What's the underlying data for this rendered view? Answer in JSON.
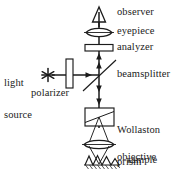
{
  "diagram": {
    "type": "optical-schematic",
    "background_color": "#ffffff",
    "line_color": "#1b1b1b",
    "labels": {
      "observer": "observer",
      "eyepiece": "eyepiece",
      "analyzer": "analyzer",
      "beamsplitter": "beamsplitter",
      "light_source_line1": "light",
      "light_source_line2": "source",
      "polarizer": "polarizer",
      "wollaston_line1": "Wollaston",
      "wollaston_line2": "prism",
      "objective_line1": "objective",
      "objective_line2": "lens",
      "sample": "sample"
    },
    "components": [
      {
        "name": "observer",
        "icon": "triangle-eye-icon"
      },
      {
        "name": "eyepiece",
        "icon": "lens-icon"
      },
      {
        "name": "analyzer",
        "icon": "plate-icon"
      },
      {
        "name": "beamsplitter",
        "icon": "diagonal-line-icon"
      },
      {
        "name": "light-source",
        "icon": "asterisk-star-icon"
      },
      {
        "name": "polarizer",
        "icon": "vertical-plate-icon"
      },
      {
        "name": "wollaston-prism",
        "icon": "prism-box-icon"
      },
      {
        "name": "objective-lens",
        "icon": "lens-icon"
      },
      {
        "name": "sample",
        "icon": "hatched-surface-icon"
      }
    ]
  }
}
